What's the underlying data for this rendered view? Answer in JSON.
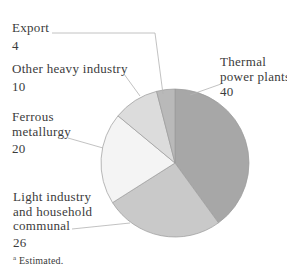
{
  "chart_data": {
    "type": "pie",
    "title": "",
    "slices": [
      {
        "label": "Thermal power plants",
        "value": 40,
        "color": "#a7a7a7"
      },
      {
        "label": "Light industry and household communal",
        "value": 26,
        "color": "#c9c9c9"
      },
      {
        "label": "Ferrous metallurgy",
        "value": 20,
        "color": "#f4f4f4"
      },
      {
        "label": "Other heavy industry",
        "value": 10,
        "color": "#dcdcdc"
      },
      {
        "label": "Export",
        "value": 4,
        "color": "#b9b9b9"
      }
    ],
    "start_angle_deg": 0,
    "direction": "clockwise",
    "legend_position": "callout-labels",
    "stroke_color": "#9b9b9b",
    "leader_line_color": "#b3b3b3",
    "footnote": "Estimated."
  },
  "labels": {
    "export": {
      "line1": "Export",
      "value": "4"
    },
    "other_heavy": {
      "line1": "Other heavy industry",
      "value": "10"
    },
    "thermal": {
      "line1": "Thermal",
      "line2": "power plants",
      "value": "40"
    },
    "ferrous": {
      "line1": "Ferrous",
      "line2": "metallurgy",
      "value": "20"
    },
    "light": {
      "line1": "Light industry",
      "line2": "and household",
      "line3": "communal",
      "value": "26"
    }
  },
  "footnote": {
    "marker": "a",
    "text": "Estimated."
  }
}
